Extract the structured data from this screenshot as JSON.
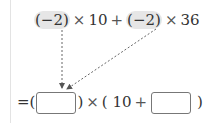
{
  "expression": {
    "top": {
      "term1": "(−2)",
      "times1": "×",
      "num1": "10",
      "plus": "+",
      "term2": "(−2)",
      "times2": "×",
      "num2": "36"
    },
    "bottom": {
      "equals_open": "=(",
      "close1": ")",
      "times": "×",
      "open2": "(",
      "num": "10",
      "plus": "+",
      "close2": ")",
      "blank1_value": "",
      "blank2_value": ""
    }
  },
  "colors": {
    "highlight": "#e6e6e6",
    "arrow": "#666666",
    "box_border": "#777777"
  }
}
